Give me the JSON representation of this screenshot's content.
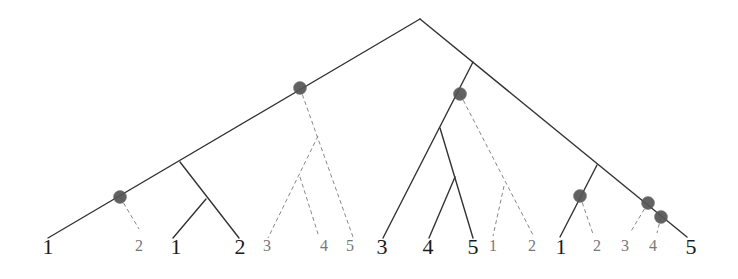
{
  "diagram": {
    "colors": {
      "solid_edge": "#333333",
      "dashed_edge": "#888888",
      "node_marker": "#555555",
      "solid_label": "#1a1a1a",
      "dashed_label": "#777777"
    },
    "leaves": [
      {
        "id": "L1",
        "label": "1",
        "style": "solid"
      },
      {
        "id": "L2",
        "label": "2",
        "style": "dashed"
      },
      {
        "id": "L3",
        "label": "1",
        "style": "solid"
      },
      {
        "id": "L4",
        "label": "2",
        "style": "solid"
      },
      {
        "id": "L5",
        "label": "3",
        "style": "dashed"
      },
      {
        "id": "L6",
        "label": "4",
        "style": "dashed"
      },
      {
        "id": "L7",
        "label": "5",
        "style": "dashed"
      },
      {
        "id": "L8",
        "label": "3",
        "style": "solid"
      },
      {
        "id": "L9",
        "label": "4",
        "style": "solid"
      },
      {
        "id": "L10",
        "label": "5",
        "style": "solid"
      },
      {
        "id": "L11",
        "label": "1",
        "style": "dashed"
      },
      {
        "id": "L12",
        "label": "2",
        "style": "dashed"
      },
      {
        "id": "L13",
        "label": "1",
        "style": "solid"
      },
      {
        "id": "L14",
        "label": "2",
        "style": "dashed"
      },
      {
        "id": "L15",
        "label": "3",
        "style": "dashed"
      },
      {
        "id": "L16",
        "label": "4",
        "style": "dashed"
      },
      {
        "id": "L17",
        "label": "5",
        "style": "solid"
      }
    ],
    "marked_node_count": 7
  }
}
